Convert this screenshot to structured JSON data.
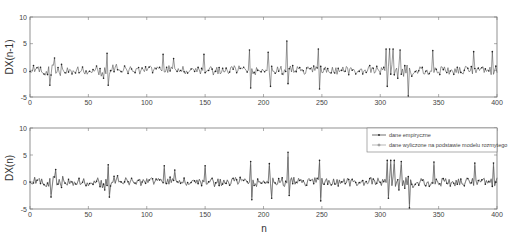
{
  "chart_data": [
    {
      "type": "line",
      "title": "",
      "xlabel": "",
      "ylabel": "DX(n-1)",
      "xlim": [
        0,
        400
      ],
      "ylim": [
        -5,
        10
      ],
      "xticks": [
        0,
        50,
        100,
        150,
        200,
        250,
        300,
        350,
        400
      ],
      "yticks": [
        -5,
        0,
        5,
        10
      ],
      "grid": false,
      "series": [
        {
          "name": "DX(n-1)",
          "style": "line with dot markers",
          "color": "#333333",
          "description": "oscillating signal around 0, mostly within [-1.5, 1.5]",
          "spikes": [
            {
              "x": 17,
              "y": -2.8
            },
            {
              "x": 21,
              "y": 2.3
            },
            {
              "x": 66,
              "y": 3.2
            },
            {
              "x": 67,
              "y": -2.8
            },
            {
              "x": 114,
              "y": 3.0
            },
            {
              "x": 123,
              "y": 2.2
            },
            {
              "x": 149,
              "y": 3.0
            },
            {
              "x": 188,
              "y": 3.8
            },
            {
              "x": 189,
              "y": -3.3
            },
            {
              "x": 204,
              "y": 3.4
            },
            {
              "x": 206,
              "y": -3.0
            },
            {
              "x": 220,
              "y": 5.5
            },
            {
              "x": 221,
              "y": -2.5
            },
            {
              "x": 247,
              "y": 4.0
            },
            {
              "x": 248,
              "y": -3.5
            },
            {
              "x": 305,
              "y": 4.0
            },
            {
              "x": 306,
              "y": -3.0
            },
            {
              "x": 308,
              "y": 4.0
            },
            {
              "x": 311,
              "y": 4.0
            },
            {
              "x": 317,
              "y": 3.8
            },
            {
              "x": 324,
              "y": -4.8
            },
            {
              "x": 345,
              "y": 3.7
            },
            {
              "x": 380,
              "y": 3.5
            },
            {
              "x": 396,
              "y": 3.5
            }
          ]
        }
      ]
    },
    {
      "type": "line",
      "title": "",
      "xlabel": "n",
      "ylabel": "DX(n)",
      "xlim": [
        0,
        400
      ],
      "ylim": [
        -5,
        10
      ],
      "xticks": [
        0,
        50,
        100,
        150,
        200,
        250,
        300,
        350,
        400
      ],
      "yticks": [
        -5,
        0,
        5,
        10
      ],
      "grid": false,
      "legend": {
        "position": "upper right",
        "entries": [
          "dane empiryczne",
          "dane wyliczone na podstawie modelu rozmytego"
        ]
      },
      "series": [
        {
          "name": "dane empiryczne",
          "style": "solid line with dot markers",
          "color": "#333333",
          "description": "oscillating signal around 0 with sparse spikes up to ~5.5 and down to ~-4.8"
        },
        {
          "name": "dane wyliczone na podstawie modelu rozmytego",
          "style": "line with + markers",
          "color": "#666666",
          "description": "model output closely tracking empirical data"
        }
      ]
    }
  ],
  "axes": {
    "top": {
      "ylabel": "DX(n-1)"
    },
    "bottom": {
      "ylabel": "DX(n)",
      "xlabel": "n"
    },
    "xtick_labels": [
      "0",
      "50",
      "100",
      "150",
      "200",
      "250",
      "300",
      "350",
      "400"
    ],
    "ytick_labels": [
      "-5",
      "0",
      "5",
      "10"
    ]
  },
  "legend": {
    "entry1": "dane empiryczne",
    "entry2": "dane wyliczone na podstawie modelu rozmytego"
  }
}
